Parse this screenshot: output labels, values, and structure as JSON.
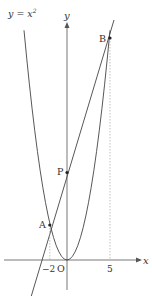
{
  "diagram": {
    "curve_label": "y = x",
    "curve_exponent": "2",
    "y_axis_label": "y",
    "x_axis_label": "x",
    "origin_label": "O",
    "points": {
      "A": {
        "label": "A",
        "x": -2,
        "y": 4
      },
      "B": {
        "label": "B",
        "x": 5,
        "y": 25
      },
      "P": {
        "label": "P",
        "x": 0,
        "y": 10
      }
    },
    "tick_labels": {
      "neg2": "−2",
      "five": "5"
    },
    "colors": {
      "line": "#333333",
      "dashed": "#888888"
    }
  }
}
